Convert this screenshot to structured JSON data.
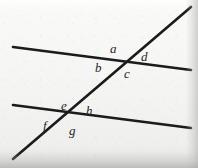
{
  "figure": {
    "background_color": "#f3f3f1",
    "ink_color": "#1a1a1c",
    "label_color": "#26262a",
    "canvas": {
      "width": 198,
      "height": 168
    }
  },
  "lines": [
    {
      "name": "upper-parallel-line",
      "role": "parallel",
      "x1": 13,
      "y1": 47,
      "x2": 191,
      "y2": 70,
      "stroke_width": 2.6
    },
    {
      "name": "lower-parallel-line",
      "role": "parallel",
      "x1": 13,
      "y1": 105,
      "x2": 191,
      "y2": 128,
      "stroke_width": 2.6
    },
    {
      "name": "transversal-line",
      "role": "transversal",
      "x1": 191,
      "y1": 7,
      "x2": 13,
      "y2": 159,
      "stroke_width": 2.6
    }
  ],
  "intersections": [
    {
      "name": "upper-intersection",
      "x": 122,
      "y": 61
    },
    {
      "name": "lower-intersection",
      "x": 65,
      "y": 119
    }
  ],
  "angle_labels": [
    {
      "id": "a",
      "text": "a",
      "x": 110,
      "y": 42,
      "position": "upper-intersection-top-left",
      "intersection": "upper-intersection"
    },
    {
      "id": "d",
      "text": "d",
      "x": 141,
      "y": 50,
      "position": "upper-intersection-top-right",
      "intersection": "upper-intersection"
    },
    {
      "id": "b",
      "text": "b",
      "x": 95,
      "y": 61,
      "position": "upper-intersection-bottom-left",
      "intersection": "upper-intersection"
    },
    {
      "id": "c",
      "text": "c",
      "x": 124,
      "y": 67,
      "position": "upper-intersection-bottom-right",
      "intersection": "upper-intersection"
    },
    {
      "id": "e",
      "text": "e",
      "x": 61,
      "y": 99,
      "position": "lower-intersection-top-left",
      "intersection": "lower-intersection"
    },
    {
      "id": "h",
      "text": "h",
      "x": 86,
      "y": 104,
      "position": "lower-intersection-top-right",
      "intersection": "lower-intersection"
    },
    {
      "id": "f",
      "text": "f",
      "x": 43,
      "y": 119,
      "position": "lower-intersection-bottom-left",
      "intersection": "lower-intersection"
    },
    {
      "id": "g",
      "text": "g",
      "x": 69,
      "y": 124,
      "position": "lower-intersection-bottom-right",
      "intersection": "lower-intersection"
    }
  ]
}
